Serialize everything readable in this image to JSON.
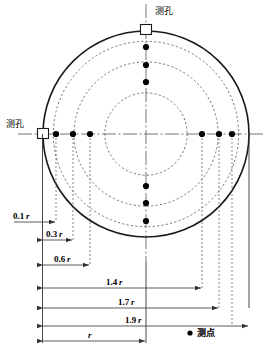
{
  "figure": {
    "colors": {
      "outline": "#1a1a1a",
      "dashed_circle": "#555555",
      "centerline": "#666666",
      "dimension": "#333333",
      "point": "#000000",
      "background": "#ffffff"
    },
    "geometry": {
      "center_x": 146,
      "center_y": 134,
      "outer_radius": 103,
      "dashed_radii_ratio": [
        0.9,
        0.7,
        0.4
      ]
    }
  },
  "ports": [
    {
      "id": "port-top",
      "label": "测孔",
      "position": "top"
    },
    {
      "id": "port-left",
      "label": "测孔",
      "position": "left"
    }
  ],
  "dimensions": [
    {
      "id": "dim-01r",
      "label": "0.1",
      "unit": "r",
      "value": 0.1
    },
    {
      "id": "dim-03r",
      "label": "0.3",
      "unit": "r",
      "value": 0.3
    },
    {
      "id": "dim-06r",
      "label": "0.6",
      "unit": "r",
      "value": 0.6
    },
    {
      "id": "dim-14r",
      "label": "1.4",
      "unit": "r",
      "value": 1.4
    },
    {
      "id": "dim-17r",
      "label": "1.7",
      "unit": "r",
      "value": 1.7
    },
    {
      "id": "dim-19r",
      "label": "1.9",
      "unit": "r",
      "value": 1.9
    },
    {
      "id": "dim-r",
      "label": "",
      "unit": "r",
      "value": 1.0
    }
  ],
  "legend": {
    "marker": "●",
    "label": "测点"
  },
  "measuring_points": {
    "horizontal": [
      {
        "x_ratio": -0.9,
        "from_left_edge": "0.1 r"
      },
      {
        "x_ratio": -0.7,
        "from_left_edge": "0.3 r"
      },
      {
        "x_ratio": -0.4,
        "from_left_edge": "0.6 r"
      },
      {
        "x_ratio": 0.4,
        "from_left_edge": "1.4 r"
      },
      {
        "x_ratio": 0.7,
        "from_left_edge": "1.7 r"
      },
      {
        "x_ratio": 0.9,
        "from_left_edge": "1.9 r"
      }
    ],
    "vertical": [
      {
        "y_ratio": -0.9
      },
      {
        "y_ratio": -0.7
      },
      {
        "y_ratio": -0.4
      },
      {
        "y_ratio": 0.4
      },
      {
        "y_ratio": 0.7
      },
      {
        "y_ratio": 0.9
      }
    ]
  }
}
